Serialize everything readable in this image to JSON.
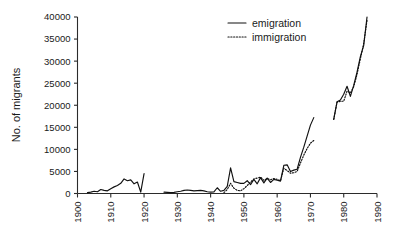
{
  "chart_data": {
    "type": "line",
    "title": "",
    "xlabel": "",
    "ylabel": "No. of migrants",
    "xlim": [
      1900,
      1990
    ],
    "ylim": [
      0,
      40000
    ],
    "grid": false,
    "legend_position": "top-center",
    "xticks": [
      "1900",
      "1910",
      "1920",
      "1930",
      "1940",
      "1950",
      "1960",
      "1970",
      "1980",
      "1990"
    ],
    "xtick_values": [
      1900,
      1910,
      1920,
      1930,
      1940,
      1950,
      1960,
      1970,
      1980,
      1990
    ],
    "yticks": [
      "0",
      "5000",
      "10000",
      "15000",
      "20000",
      "25000",
      "30000",
      "35000",
      "40000"
    ],
    "ytick_values": [
      0,
      5000,
      10000,
      15000,
      20000,
      25000,
      30000,
      35000,
      40000
    ],
    "series": [
      {
        "name": "emigration",
        "style": "solid",
        "color": "#111111",
        "segments": [
          {
            "x": [
              1903,
              1904,
              1905,
              1906,
              1907,
              1908,
              1909,
              1910,
              1911,
              1912,
              1913,
              1914,
              1915,
              1916,
              1917,
              1918,
              1919,
              1920
            ],
            "y": [
              200,
              300,
              500,
              400,
              900,
              700,
              600,
              1100,
              1500,
              1800,
              2300,
              3300,
              2900,
              3100,
              2200,
              2600,
              300,
              4500
            ]
          },
          {
            "x": [
              1926,
              1927,
              1928,
              1929,
              1930,
              1931,
              1932,
              1933,
              1934,
              1935,
              1936,
              1937,
              1938,
              1939,
              1940,
              1941,
              1942,
              1943,
              1944,
              1945,
              1946,
              1947,
              1948,
              1949,
              1950,
              1951,
              1952,
              1953,
              1954,
              1955,
              1956,
              1957,
              1958,
              1959,
              1960,
              1961,
              1962,
              1963,
              1964,
              1965,
              1966,
              1967,
              1968,
              1969,
              1970,
              1971
            ],
            "y": [
              300,
              250,
              200,
              250,
              400,
              500,
              700,
              800,
              700,
              600,
              650,
              700,
              600,
              400,
              300,
              350,
              1300,
              500,
              700,
              1600,
              5800,
              2700,
              2500,
              2300,
              2300,
              2900,
              2000,
              3200,
              2200,
              3600,
              2400,
              3500,
              2500,
              3200,
              3000,
              2800,
              6400,
              6500,
              5000,
              5300,
              5500,
              8200,
              10500,
              13000,
              15500,
              17200
            ]
          },
          {
            "x": [
              1977,
              1978,
              1979,
              1980,
              1981,
              1982,
              1983,
              1984,
              1985,
              1986,
              1987
            ],
            "y": [
              16800,
              20800,
              21200,
              22500,
              24300,
              22000,
              24500,
              27500,
              31000,
              33500,
              40000
            ]
          }
        ]
      },
      {
        "name": "immigration",
        "style": "dotted",
        "color": "#111111",
        "segments": [
          {
            "x": [
              1944,
              1945,
              1946,
              1947,
              1948,
              1949,
              1950,
              1951,
              1952,
              1953,
              1954,
              1955,
              1956,
              1957,
              1958,
              1959,
              1960,
              1961,
              1962,
              1963,
              1964,
              1965,
              1966,
              1967,
              1968,
              1969,
              1970,
              1971
            ],
            "y": [
              200,
              900,
              2300,
              1200,
              700,
              600,
              1100,
              1800,
              2600,
              3300,
              3500,
              3700,
              3000,
              3400,
              3100,
              3400,
              3200,
              2900,
              5700,
              5200,
              4600,
              4700,
              5000,
              6900,
              8700,
              10200,
              11400,
              12000
            ]
          },
          {
            "x": [
              1977,
              1978,
              1979,
              1980,
              1981,
              1982,
              1983,
              1984,
              1985,
              1986,
              1987
            ],
            "y": [
              16800,
              20700,
              20900,
              20900,
              23200,
              22800,
              24200,
              27000,
              30500,
              34000,
              39200
            ]
          }
        ]
      }
    ]
  },
  "legend": {
    "items": [
      {
        "label": "emigration",
        "style": "solid"
      },
      {
        "label": "immigration",
        "style": "dotted"
      }
    ]
  }
}
